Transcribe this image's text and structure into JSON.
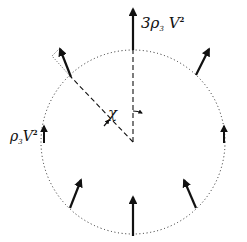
{
  "diagram": {
    "labels": {
      "top_flux": {
        "coef": "3",
        "rho": "ρ",
        "sub": "3",
        "v": "V",
        "sup": "2"
      },
      "side_flux": {
        "rho": "ρ",
        "sub": "3",
        "v": "V",
        "sup": "2"
      },
      "angle": "χ"
    },
    "colors": {
      "ink": "#111111",
      "background": "#ffffff"
    },
    "circle": {
      "cx": 133,
      "cy": 142,
      "r": 92,
      "style": "dotted"
    },
    "arrows": [
      {
        "name": "top",
        "x1": 133,
        "y1": 50,
        "x2": 133,
        "y2": 8
      },
      {
        "name": "upper-left",
        "x1": 71,
        "y1": 77,
        "x2": 60,
        "y2": 48
      },
      {
        "name": "upper-right",
        "x1": 196,
        "y1": 75,
        "x2": 209,
        "y2": 48
      },
      {
        "name": "left",
        "x1": 44,
        "y1": 143,
        "x2": 44,
        "y2": 125
      },
      {
        "name": "right",
        "x1": 224,
        "y1": 143,
        "x2": 224,
        "y2": 125
      },
      {
        "name": "lower-left",
        "x1": 70,
        "y1": 208,
        "x2": 81,
        "y2": 179
      },
      {
        "name": "lower-right",
        "x1": 196,
        "y1": 208,
        "x2": 184,
        "y2": 179
      },
      {
        "name": "bottom",
        "x1": 133,
        "y1": 236,
        "x2": 133,
        "y2": 196
      }
    ]
  }
}
